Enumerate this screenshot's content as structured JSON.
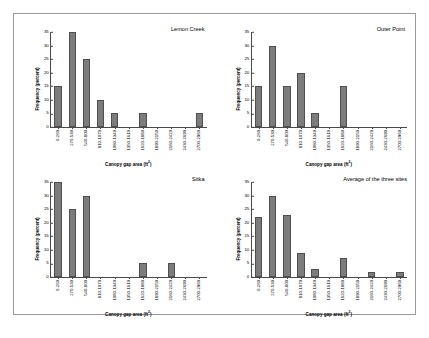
{
  "figure": {
    "axis_titles": {
      "y": "Frequency (percent)",
      "x": "Canopy gap area (ft",
      "x_superscript": "2",
      "x_close": ")"
    },
    "y_ticks": [
      "35",
      "30",
      "25",
      "20",
      "15",
      "10",
      "5",
      "0"
    ],
    "categories": [
      "0-269",
      "270-539",
      "540-809",
      "810-1079",
      "1080-1349",
      "1350-1619",
      "1620-1889",
      "1890-2159",
      "2160-2429",
      "2430-2699",
      "2700-2969"
    ],
    "bar_color": "#7c7c7c",
    "bar_edge_color": "#4f4f4f",
    "frame_color": "#9a9a9a"
  },
  "chart_data": [
    {
      "type": "bar",
      "title": "Lemon Creek",
      "xlabel": "Canopy gap area (ft2)",
      "ylabel": "Frequency (percent)",
      "categories": [
        "0-269",
        "270-539",
        "540-809",
        "810-1079",
        "1080-1349",
        "1350-1619",
        "1620-1889",
        "1890-2159",
        "2160-2429",
        "2430-2699",
        "2700-2969"
      ],
      "values": [
        15,
        35,
        25,
        10,
        5,
        0,
        5,
        0,
        0,
        0,
        5
      ],
      "ylim": [
        0,
        35
      ],
      "yticks": [
        0,
        5,
        10,
        15,
        20,
        25,
        30,
        35
      ],
      "grid": false,
      "legend": "none"
    },
    {
      "type": "bar",
      "title": "Outer Point",
      "xlabel": "Canopy gap area (ft2)",
      "ylabel": "Frequency (percent)",
      "categories": [
        "0-269",
        "270-539",
        "540-809",
        "810-1079",
        "1080-1349",
        "1350-1619",
        "1620-1889",
        "1890-2159",
        "2160-2429",
        "2430-2699",
        "2700-2969"
      ],
      "values": [
        15,
        30,
        15,
        20,
        5,
        0,
        15,
        0,
        0,
        0,
        0
      ],
      "ylim": [
        0,
        35
      ],
      "yticks": [
        0,
        5,
        10,
        15,
        20,
        25,
        30,
        35
      ],
      "grid": false,
      "legend": "none"
    },
    {
      "type": "bar",
      "title": "Sitka",
      "xlabel": "Canopy gap area (ft2)",
      "ylabel": "Frequency (percent)",
      "categories": [
        "0-269",
        "270-539",
        "540-809",
        "810-1079",
        "1080-1349",
        "1350-1619",
        "1620-1889",
        "1890-2159",
        "2160-2429",
        "2430-2699",
        "2700-2969"
      ],
      "values": [
        35,
        25,
        30,
        0,
        0,
        0,
        5,
        0,
        5,
        0,
        0
      ],
      "ylim": [
        0,
        35
      ],
      "yticks": [
        0,
        5,
        10,
        15,
        20,
        25,
        30,
        35
      ],
      "grid": false,
      "legend": "none"
    },
    {
      "type": "bar",
      "title": "Average of the three sites",
      "xlabel": "Canopy gap area (ft2)",
      "ylabel": "Frequency (percent)",
      "categories": [
        "0-269",
        "270-539",
        "540-809",
        "810-1079",
        "1080-1349",
        "1350-1619",
        "1620-1889",
        "1890-2159",
        "2160-2429",
        "2430-2699",
        "2700-2969"
      ],
      "values": [
        22,
        30,
        23,
        9,
        3,
        0,
        7,
        0,
        2,
        0,
        2
      ],
      "ylim": [
        0,
        35
      ],
      "yticks": [
        0,
        5,
        10,
        15,
        20,
        25,
        30,
        35
      ],
      "grid": false,
      "legend": "none"
    }
  ]
}
